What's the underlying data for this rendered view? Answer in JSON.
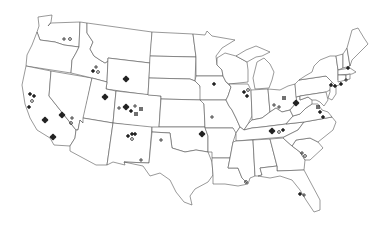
{
  "map": {
    "title": "",
    "region": "Contiguous United States",
    "colors": {
      "background": "#ffffff",
      "border": "#555555",
      "marker": "#222222"
    },
    "marker_types": [
      "cluster",
      "plus",
      "circle",
      "dot",
      "hash"
    ],
    "markers": [
      {
        "type": "plus",
        "x": 64,
        "y": 39
      },
      {
        "type": "circle",
        "x": 70,
        "y": 39
      },
      {
        "type": "plus",
        "x": 96,
        "y": 67
      },
      {
        "type": "dot",
        "x": 93,
        "y": 71
      },
      {
        "type": "circle",
        "x": 98,
        "y": 72
      },
      {
        "type": "cluster",
        "x": 126,
        "y": 79
      },
      {
        "type": "cluster",
        "x": 105,
        "y": 97
      },
      {
        "type": "plus",
        "x": 119,
        "y": 108
      },
      {
        "type": "cluster",
        "x": 126,
        "y": 107
      },
      {
        "type": "dot",
        "x": 131,
        "y": 111
      },
      {
        "type": "plus",
        "x": 135,
        "y": 106
      },
      {
        "type": "hash",
        "x": 141,
        "y": 109
      },
      {
        "type": "hash",
        "x": 136,
        "y": 114
      },
      {
        "type": "dot",
        "x": 30,
        "y": 94
      },
      {
        "type": "dot",
        "x": 34,
        "y": 96
      },
      {
        "type": "circle",
        "x": 32,
        "y": 101
      },
      {
        "type": "dot",
        "x": 29,
        "y": 107
      },
      {
        "type": "cluster",
        "x": 62,
        "y": 115
      },
      {
        "type": "plus",
        "x": 72,
        "y": 118
      },
      {
        "type": "circle",
        "x": 71,
        "y": 123
      },
      {
        "type": "cluster",
        "x": 45,
        "y": 120
      },
      {
        "type": "cluster",
        "x": 53,
        "y": 137
      },
      {
        "type": "dot",
        "x": 128,
        "y": 136
      },
      {
        "type": "dot",
        "x": 132,
        "y": 134
      },
      {
        "type": "dot",
        "x": 135,
        "y": 134
      },
      {
        "type": "circle",
        "x": 132,
        "y": 139
      },
      {
        "type": "plus",
        "x": 161,
        "y": 140
      },
      {
        "type": "plus",
        "x": 141,
        "y": 160
      },
      {
        "type": "cluster",
        "x": 202,
        "y": 134
      },
      {
        "type": "plus",
        "x": 212,
        "y": 117
      },
      {
        "type": "dot",
        "x": 214,
        "y": 84
      },
      {
        "type": "dot",
        "x": 244,
        "y": 92
      },
      {
        "type": "circle",
        "x": 248,
        "y": 90
      },
      {
        "type": "dot",
        "x": 247,
        "y": 96
      },
      {
        "type": "hash",
        "x": 284,
        "y": 98
      },
      {
        "type": "plus",
        "x": 274,
        "y": 105
      },
      {
        "type": "plus",
        "x": 279,
        "y": 107
      },
      {
        "type": "cluster",
        "x": 296,
        "y": 103
      },
      {
        "type": "hash",
        "x": 318,
        "y": 107
      },
      {
        "type": "dot",
        "x": 320,
        "y": 112
      },
      {
        "type": "dot",
        "x": 323,
        "y": 117
      },
      {
        "type": "cluster",
        "x": 272,
        "y": 131
      },
      {
        "type": "circle",
        "x": 279,
        "y": 132
      },
      {
        "type": "dot",
        "x": 283,
        "y": 130
      },
      {
        "type": "plus",
        "x": 302,
        "y": 153
      },
      {
        "type": "circle",
        "x": 305,
        "y": 156
      },
      {
        "type": "dot",
        "x": 331,
        "y": 85
      },
      {
        "type": "dot",
        "x": 335,
        "y": 86
      },
      {
        "type": "dot",
        "x": 341,
        "y": 84
      },
      {
        "type": "dot",
        "x": 348,
        "y": 68
      },
      {
        "type": "plus",
        "x": 346,
        "y": 80
      },
      {
        "type": "circle",
        "x": 246,
        "y": 182
      },
      {
        "type": "dot",
        "x": 300,
        "y": 194
      },
      {
        "type": "plus",
        "x": 304,
        "y": 195
      }
    ]
  }
}
